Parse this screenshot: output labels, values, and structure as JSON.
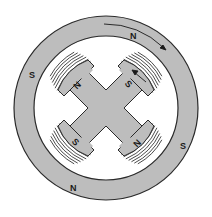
{
  "diagram": {
    "colors": {
      "iron": "#bdbdbd",
      "outline": "#2a2a2a",
      "coil_fill": "#ffffff",
      "background": "#ffffff"
    },
    "stator_labels": [
      {
        "text": "N",
        "position": "top-right"
      },
      {
        "text": "S",
        "position": "left"
      },
      {
        "text": "S",
        "position": "right"
      },
      {
        "text": "N",
        "position": "bottom-left"
      }
    ],
    "rotor_labels": [
      {
        "text": "N",
        "position": "upper-left-pole"
      },
      {
        "text": "S",
        "position": "upper-right-pole"
      },
      {
        "text": "S",
        "position": "lower-left-pole"
      },
      {
        "text": "N",
        "position": "lower-right-pole"
      }
    ],
    "arrows": [
      {
        "name": "stator-rotation-arrow",
        "direction": "clockwise"
      },
      {
        "name": "rotor-pole-arrow",
        "direction": "toward-upper-left"
      }
    ]
  }
}
